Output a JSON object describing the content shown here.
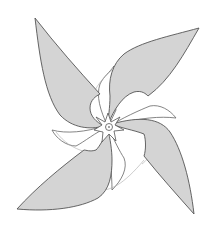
{
  "image": {
    "subject": "pinwheel line drawing",
    "width": 212,
    "height": 232,
    "background": "#ffffff",
    "colors": {
      "blade_fill": "#d4d4d4",
      "outline": "#555555",
      "fold_fill": "#ffffff"
    },
    "blades": [
      {
        "name": "top-left",
        "tip": [
          35,
          18
        ]
      },
      {
        "name": "top-right",
        "tip": [
          199,
          28
        ]
      },
      {
        "name": "bottom-right",
        "tip": [
          194,
          214
        ]
      },
      {
        "name": "bottom-left",
        "tip": [
          17,
          209
        ]
      }
    ],
    "hub": {
      "center": [
        108,
        127
      ],
      "shape": "six-point star with circle"
    }
  }
}
